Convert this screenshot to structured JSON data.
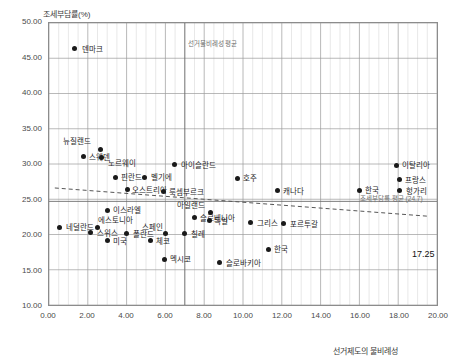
{
  "chart_data": {
    "type": "scatter",
    "title": "",
    "ylabel": "조세부담률(%)",
    "xlabel": "선거제도의 불비례성",
    "xlim": [
      0.0,
      20.0
    ],
    "ylim": [
      10.0,
      50.0
    ],
    "xticks": [
      "0.00",
      "2.00",
      "4.00",
      "6.00",
      "8.00",
      "10.00",
      "12.00",
      "14.00",
      "16.00",
      "18.00",
      "20.00"
    ],
    "yticks": [
      "10.00",
      "15.00",
      "20.00",
      "25.00",
      "30.00",
      "35.00",
      "40.00",
      "45.00",
      "50.00"
    ],
    "grid": true,
    "legend": "none",
    "points": [
      {
        "label": "덴마크",
        "x": 1.35,
        "y": 46.2,
        "lx": 8,
        "ly": -3
      },
      {
        "label": "뉴질랜드",
        "x": 2.7,
        "y": 32.1,
        "lx": -10,
        "ly": -11
      },
      {
        "label": "스웨덴",
        "x": 1.8,
        "y": 31.0,
        "lx": 6,
        "ly": -3
      },
      {
        "label": "노르웨이",
        "x": 2.75,
        "y": 30.9,
        "lx": 6,
        "ly": 2
      },
      {
        "label": "핀란드",
        "x": 3.45,
        "y": 28.1,
        "lx": 6,
        "ly": -3
      },
      {
        "label": "벨기에",
        "x": 4.95,
        "y": 28.1,
        "lx": 6,
        "ly": -3
      },
      {
        "label": "아이슬란드",
        "x": 6.5,
        "y": 29.9,
        "lx": 6,
        "ly": -3
      },
      {
        "label": "오스트리아",
        "x": 4.1,
        "y": 26.4,
        "lx": 4,
        "ly": -3
      },
      {
        "label": "룩셈부르크",
        "x": 5.9,
        "y": 26.1,
        "lx": 6,
        "ly": -3
      },
      {
        "label": "호주",
        "x": 9.7,
        "y": 28.0,
        "lx": 6,
        "ly": -3
      },
      {
        "label": "캐나다",
        "x": 11.75,
        "y": 26.2,
        "lx": 6,
        "ly": -3
      },
      {
        "label": "한국",
        "x": 15.95,
        "y": 26.3,
        "lx": 6,
        "ly": -3
      },
      {
        "label": "이탈리아",
        "x": 17.85,
        "y": 29.8,
        "lx": 6,
        "ly": -3
      },
      {
        "label": "프랑스",
        "x": 18.0,
        "y": 27.8,
        "lx": 6,
        "ly": -3
      },
      {
        "label": "헝가리",
        "x": 18.05,
        "y": 26.2,
        "lx": 6,
        "ly": -3
      },
      {
        "label": "이스라엘",
        "x": 3.05,
        "y": 23.5,
        "lx": 6,
        "ly": -3
      },
      {
        "label": "아일랜드",
        "x": 8.35,
        "y": 23.2,
        "lx": -6,
        "ly": -10
      },
      {
        "label": "슬로베니아",
        "x": 7.5,
        "y": 22.4,
        "lx": 6,
        "ly": -3
      },
      {
        "label": "독일",
        "x": 8.3,
        "y": 22.0,
        "lx": 4,
        "ly": -3
      },
      {
        "label": "그리스",
        "x": 10.4,
        "y": 21.7,
        "lx": 6,
        "ly": -3
      },
      {
        "label": "포르투갈",
        "x": 12.1,
        "y": 21.6,
        "lx": 6,
        "ly": -3
      },
      {
        "label": "네덜란드",
        "x": 0.6,
        "y": 21.1,
        "lx": 6,
        "ly": -3
      },
      {
        "label": "에스토니아",
        "x": 2.55,
        "y": 21.1,
        "lx": 0,
        "ly": -10
      },
      {
        "label": "스위스",
        "x": 2.2,
        "y": 20.3,
        "lx": 6,
        "ly": -3
      },
      {
        "label": "폴란드",
        "x": 4.05,
        "y": 20.2,
        "lx": 6,
        "ly": -3
      },
      {
        "label": "스페인",
        "x": 6.05,
        "y": 20.2,
        "lx": -3,
        "ly": -10
      },
      {
        "label": "칠레",
        "x": 7.0,
        "y": 20.2,
        "lx": 6,
        "ly": -3
      },
      {
        "label": "미국",
        "x": 3.05,
        "y": 19.2,
        "lx": 6,
        "ly": -3
      },
      {
        "label": "체코",
        "x": 5.25,
        "y": 19.2,
        "lx": 6,
        "ly": -3
      },
      {
        "label": "한국",
        "x": 11.3,
        "y": 18.0,
        "lx": 6,
        "ly": -3
      },
      {
        "label": "멕시코",
        "x": 5.95,
        "y": 16.6,
        "lx": 6,
        "ly": -3
      },
      {
        "label": "슬로바키아",
        "x": 8.8,
        "y": 16.1,
        "lx": 6,
        "ly": -3
      }
    ],
    "reference_lines": {
      "x_mean": {
        "value": 7.0,
        "label": "선거불비례성 평균"
      },
      "y_mean": {
        "value": 24.7,
        "label": "조세부담률 평균 (24.7)"
      }
    },
    "trend_line": {
      "x_start": 0.3,
      "y_start": 26.6,
      "x_end": 19.5,
      "y_end": 22.6
    },
    "callout": {
      "text": "17.25",
      "x": 20.0,
      "y": 17.25
    }
  }
}
